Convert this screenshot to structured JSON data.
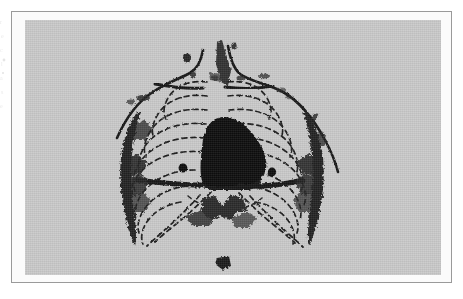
{
  "document": {
    "type": "scanned-book-page",
    "page_background": "#ffffff",
    "has_visible_caption": false,
    "has_visible_page_number": false,
    "marginalia": "faint show-through marks from facing page along left edge"
  },
  "plate": {
    "frame_color": "#9a9a9a",
    "mount_color": "#fbfbfb",
    "image_background": "#c9c9c9",
    "ink_color": "#161616",
    "smudge_color": "#3a3a3a",
    "frame": {
      "x": 11,
      "y": 11,
      "width": 441,
      "height": 272
    },
    "image_area": {
      "x": 25,
      "y": 20,
      "width": 416,
      "height": 255
    }
  },
  "figure": {
    "view": "frontal / postero-anterior",
    "rendering": "line drawing over gray halftone ground",
    "elements": [
      {
        "name": "neck-and-shoulder-outline",
        "style": "solid ink contour",
        "description": "continuous line from left shoulder up over neck and down to right shoulder"
      },
      {
        "name": "clavicle-left",
        "style": "solid ink stroke",
        "description": "horizontal bone line across upper left thorax"
      },
      {
        "name": "clavicle-right",
        "style": "solid ink stroke",
        "description": "horizontal bone line across upper right thorax"
      },
      {
        "name": "rib-cage-left",
        "style": "dashed arcs",
        "count": 9,
        "description": "stacked dashed rib arcs descending on the left hemithorax"
      },
      {
        "name": "rib-cage-right",
        "style": "dashed arcs",
        "count": 9,
        "description": "stacked dashed rib arcs descending on the right hemithorax"
      },
      {
        "name": "mediastinal-silhouette",
        "style": "solid filled black",
        "description": "large dense central shadow with rounded dome apex widening inferiorly"
      },
      {
        "name": "diaphragm-line",
        "style": "heavy solid horizontal band",
        "description": "dark band crossing the thorax at the lung bases"
      },
      {
        "name": "costal-margin-left",
        "style": "dashed descending arc",
        "description": "lower rib border sloping down and laterally"
      },
      {
        "name": "costal-margin-right",
        "style": "dashed descending arc",
        "description": "lower rib border sloping down and laterally"
      },
      {
        "name": "lateral-chest-wall-shadow-left",
        "style": "dark irregular smudge",
        "description": "dense ragged ink along the left lateral thoracic margin"
      },
      {
        "name": "lateral-chest-wall-shadow-right",
        "style": "dark irregular smudge",
        "description": "dense ragged ink along the right lateral thoracic margin"
      },
      {
        "name": "nodule-left",
        "style": "small filled circle",
        "description": "small round dense opacity in the left mid lung field"
      },
      {
        "name": "nodule-right",
        "style": "small filled circle",
        "description": "small round dense opacity in the right mid lung field"
      },
      {
        "name": "subdiaphragmatic-shadow",
        "style": "irregular dark blot",
        "description": "angular dark area below the diaphragm near the midline"
      },
      {
        "name": "infra-thoracic-mark",
        "style": "small dark blot",
        "description": "isolated small dark arrowhead-like mark low in the midline"
      },
      {
        "name": "supraclavicular-marks",
        "style": "small dark blots",
        "description": "scattered dark specks above and lateral to the clavicles"
      }
    ]
  }
}
